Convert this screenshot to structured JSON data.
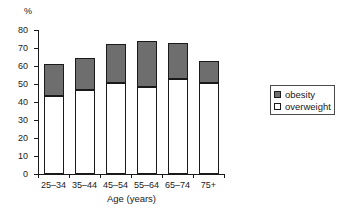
{
  "chart_data": {
    "type": "bar",
    "subtype": "stacked-vertical",
    "title": "",
    "xlabel": "Age (years)",
    "ylabel": "%",
    "y_unit_label": "%",
    "categories": [
      "25–34",
      "35–44",
      "45–54",
      "55–64",
      "65–74",
      "75+"
    ],
    "series": [
      {
        "name": "overweight",
        "color": "#ffffff",
        "values": [
          43.5,
          46.5,
          50.5,
          48.5,
          53.0,
          50.5
        ]
      },
      {
        "name": "obesity",
        "color": "#6e6e6e",
        "values": [
          17.5,
          18.0,
          21.5,
          25.5,
          20.0,
          12.5
        ]
      }
    ],
    "totals": [
      61.0,
      64.5,
      72.0,
      74.0,
      73.0,
      63.0
    ],
    "ylim": [
      0,
      80
    ],
    "yticks": [
      0,
      10,
      20,
      30,
      40,
      50,
      60,
      70,
      80
    ],
    "ytick_labels": [
      "0",
      "10",
      "20",
      "30",
      "40",
      "50",
      "60",
      "70",
      "80"
    ],
    "grid": false,
    "legend_position": "right",
    "legend_entries": [
      "obesity",
      "overweight"
    ]
  },
  "axes": {
    "y_unit": "%",
    "x_title": "Age (years)"
  },
  "legend": {
    "items": [
      {
        "label": "obesity",
        "swatch": "filled-gray-square"
      },
      {
        "label": "overweight",
        "swatch": "empty-white-square"
      }
    ]
  },
  "colors": {
    "obesity": "#6e6e6e",
    "overweight": "#ffffff",
    "axis": "#1a1a1a",
    "background": "#ffffff"
  }
}
